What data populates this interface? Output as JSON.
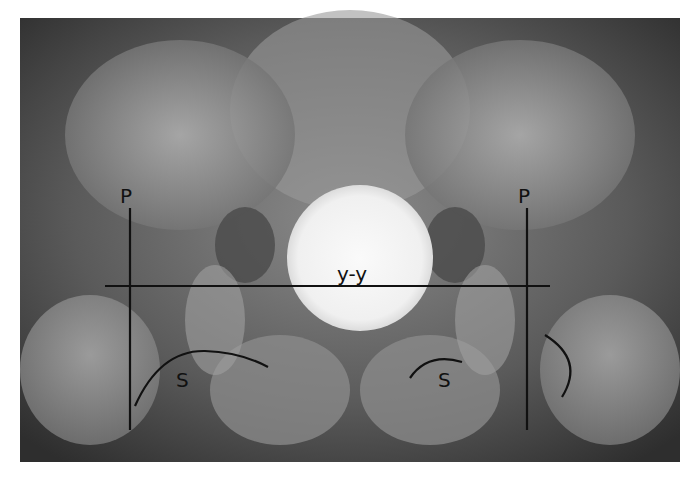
{
  "image": {
    "description": "Pelvis AP radiograph with hip measurement annotations",
    "labels": {
      "perkin_left": "P",
      "perkin_right": "P",
      "hilgenreiner": "y-y",
      "shenton_left": "S",
      "shenton_right": "S"
    },
    "colors": {
      "background_border": "#ffffff",
      "xray_dark": "#3a3a3a",
      "xray_mid": "#7a7a7a",
      "bone_light": "#b8b8b8",
      "gonad_shield": "#f4f4f4",
      "annotation_line": "#111111"
    }
  }
}
